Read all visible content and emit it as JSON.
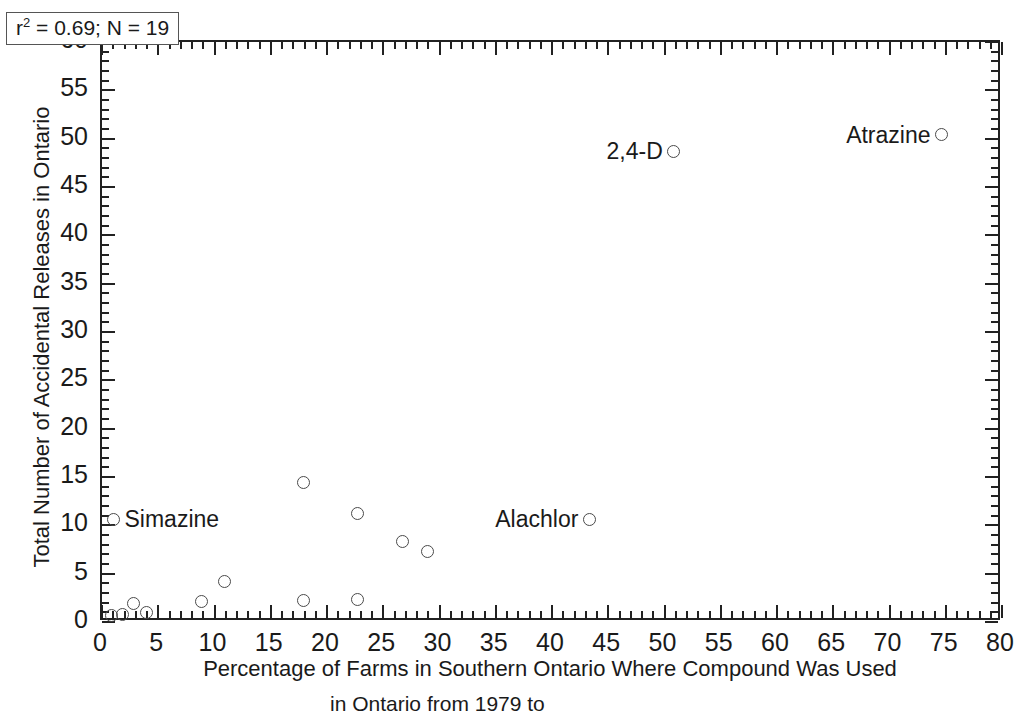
{
  "chart_data": {
    "type": "scatter",
    "title": "",
    "xlabel": "Percentage of Farms in Southern Ontario Where Compound Was Used",
    "ylabel": "Total Number of Accidental Releases in Ontario",
    "xlim": [
      0,
      80
    ],
    "ylim": [
      0,
      60
    ],
    "xticks": [
      0,
      5,
      10,
      15,
      20,
      25,
      30,
      35,
      40,
      45,
      50,
      55,
      60,
      65,
      70,
      75,
      80
    ],
    "yticks": [
      0,
      5,
      10,
      15,
      20,
      25,
      30,
      35,
      40,
      45,
      50,
      55,
      60
    ],
    "xtick_labels": [
      "0",
      "5",
      "10",
      "15",
      "20",
      "25",
      "30",
      "35",
      "40",
      "45",
      "50",
      "55",
      "60",
      "65",
      "70",
      "75",
      "80"
    ],
    "ytick_labels": [
      "0",
      "5",
      "10",
      "15",
      "20",
      "25",
      "30",
      "35",
      "40",
      "45",
      "50",
      "55",
      "60"
    ],
    "grid": false,
    "legend": false,
    "minor_ticks_per_interval": 5,
    "marker_style": "open-circle",
    "annotation": {
      "r_squared": "0.69",
      "n": "19",
      "text_prefix": "r",
      "text_superscript": "2",
      "text_body": " = 0.69; N = 19"
    },
    "points": [
      {
        "x": 1.2,
        "y": 10.4,
        "label": "Simazine",
        "label_side": "right"
      },
      {
        "x": 1.0,
        "y": 0.5,
        "label": "",
        "label_side": ""
      },
      {
        "x": 2.0,
        "y": 0.6,
        "label": "",
        "label_side": ""
      },
      {
        "x": 3.0,
        "y": 1.7,
        "label": "",
        "label_side": ""
      },
      {
        "x": 4.1,
        "y": 0.8,
        "label": "",
        "label_side": ""
      },
      {
        "x": 9.0,
        "y": 1.9,
        "label": "",
        "label_side": ""
      },
      {
        "x": 11.1,
        "y": 4.0,
        "label": "",
        "label_side": ""
      },
      {
        "x": 18.1,
        "y": 14.2,
        "label": "",
        "label_side": ""
      },
      {
        "x": 18.1,
        "y": 2.0,
        "label": "",
        "label_side": ""
      },
      {
        "x": 22.9,
        "y": 11.0,
        "label": "",
        "label_side": ""
      },
      {
        "x": 22.9,
        "y": 2.1,
        "label": "",
        "label_side": ""
      },
      {
        "x": 26.9,
        "y": 8.1,
        "label": "",
        "label_side": ""
      },
      {
        "x": 29.1,
        "y": 7.1,
        "label": "",
        "label_side": ""
      },
      {
        "x": 43.5,
        "y": 10.4,
        "label": "Alachlor",
        "label_side": "left"
      },
      {
        "x": 51.0,
        "y": 48.5,
        "label": "2,4-D",
        "label_side": "left"
      },
      {
        "x": 74.8,
        "y": 50.2,
        "label": "Atrazine",
        "label_side": "left"
      }
    ],
    "note": "19 compounds total; several near-origin markers overlap"
  },
  "caption": {
    "visible_fragment": "in Ontario from 1979 to"
  }
}
